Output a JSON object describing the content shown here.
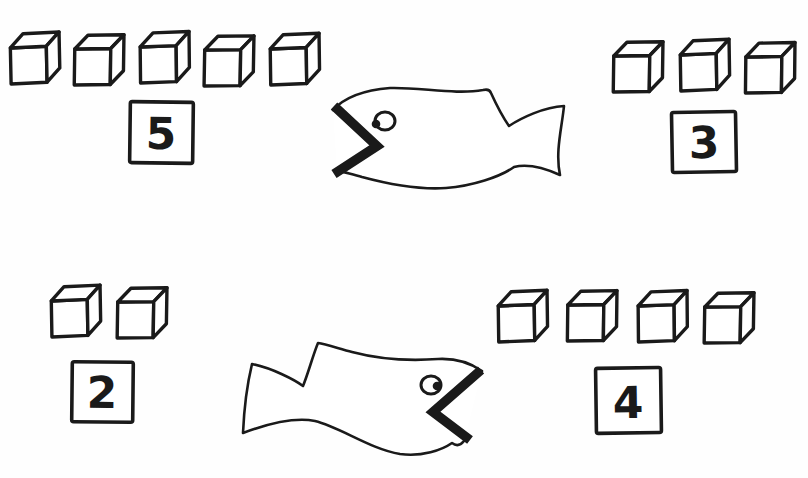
{
  "colors": {
    "ink": "#1a1a1a",
    "paper": "#fefefe"
  },
  "worksheet": {
    "kind": "number-comparison drawing with cubes and big-mouth fish",
    "problems": [
      {
        "name": "top",
        "left": {
          "cube_count": 5,
          "number": "5"
        },
        "right": {
          "cube_count": 3,
          "number": "3"
        },
        "fish_mouth_opens": "left"
      },
      {
        "name": "bottom",
        "left": {
          "cube_count": 2,
          "number": "2"
        },
        "right": {
          "cube_count": 4,
          "number": "4"
        },
        "fish_mouth_opens": "right"
      }
    ]
  }
}
